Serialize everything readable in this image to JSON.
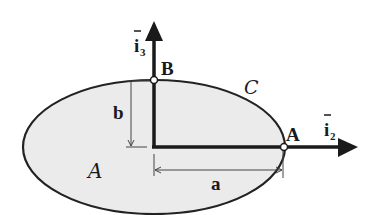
{
  "diagram": {
    "type": "ellipse-cross-section",
    "colors": {
      "fill": "#ebebeb",
      "stroke": "#222222",
      "background": "#ffffff"
    },
    "labels": {
      "point_a": "A",
      "point_b": "B",
      "curve": "C",
      "area": "A",
      "semi_major": "a",
      "semi_minor": "b",
      "axis_horizontal": "i",
      "axis_horizontal_sub": "2",
      "axis_vertical": "i",
      "axis_vertical_sub": "3"
    }
  }
}
